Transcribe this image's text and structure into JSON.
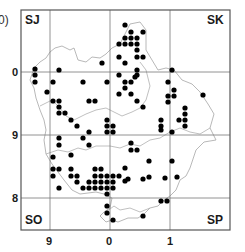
{
  "map": {
    "partial_label": "0)",
    "corner_labels": {
      "top_left": "SJ",
      "top_right": "SK",
      "bottom_left": "SO",
      "bottom_right": "SP"
    },
    "y_axis_labels": [
      "0",
      "9",
      "8"
    ],
    "x_axis_labels": [
      "9",
      "0",
      "1"
    ],
    "colors": {
      "frame": "#555555",
      "grid": "#777777",
      "boundary": "#b0b0b0",
      "dot": "#000000",
      "text": "#1a1a1a"
    },
    "dots": [
      [
        125,
        25
      ],
      [
        131,
        32
      ],
      [
        143,
        32
      ],
      [
        125,
        38
      ],
      [
        131,
        38
      ],
      [
        137,
        38
      ],
      [
        119,
        44
      ],
      [
        125,
        44
      ],
      [
        131,
        44
      ],
      [
        137,
        44
      ],
      [
        137,
        50
      ],
      [
        119,
        57
      ],
      [
        137,
        57
      ],
      [
        143,
        57
      ],
      [
        125,
        63
      ],
      [
        102,
        63
      ],
      [
        137,
        70
      ],
      [
        119,
        75
      ],
      [
        137,
        75
      ],
      [
        35,
        69
      ],
      [
        35,
        75
      ],
      [
        35,
        82
      ],
      [
        59,
        70
      ],
      [
        53,
        82
      ],
      [
        83,
        82
      ],
      [
        107,
        82
      ],
      [
        47,
        92
      ],
      [
        53,
        101
      ],
      [
        59,
        101
      ],
      [
        89,
        101
      ],
      [
        95,
        101
      ],
      [
        59,
        107
      ],
      [
        59,
        113
      ],
      [
        65,
        113
      ],
      [
        71,
        120
      ],
      [
        77,
        126
      ],
      [
        107,
        120
      ],
      [
        107,
        126
      ],
      [
        107,
        132
      ],
      [
        113,
        126
      ],
      [
        113,
        132
      ],
      [
        135,
        77
      ],
      [
        125,
        82
      ],
      [
        131,
        82
      ],
      [
        125,
        88
      ],
      [
        119,
        94
      ],
      [
        131,
        94
      ],
      [
        172,
        70
      ],
      [
        168,
        82
      ],
      [
        174,
        90
      ],
      [
        174,
        96
      ],
      [
        168,
        96
      ],
      [
        168,
        102
      ],
      [
        203,
        95
      ],
      [
        185,
        108
      ],
      [
        185,
        114
      ],
      [
        185,
        120
      ],
      [
        179,
        120
      ],
      [
        185,
        126
      ],
      [
        161,
        120
      ],
      [
        161,
        126
      ],
      [
        137,
        101
      ],
      [
        143,
        107
      ],
      [
        161,
        130
      ],
      [
        172,
        132
      ],
      [
        59,
        138
      ],
      [
        59,
        145
      ],
      [
        83,
        138
      ],
      [
        89,
        132
      ],
      [
        89,
        145
      ],
      [
        71,
        155
      ],
      [
        53,
        157
      ],
      [
        131,
        143
      ],
      [
        131,
        150
      ],
      [
        137,
        150
      ],
      [
        125,
        168
      ],
      [
        149,
        161
      ],
      [
        172,
        161
      ],
      [
        128,
        179
      ],
      [
        143,
        179
      ],
      [
        149,
        177
      ],
      [
        165,
        178
      ],
      [
        177,
        177
      ],
      [
        125,
        181
      ],
      [
        53,
        169
      ],
      [
        59,
        169
      ],
      [
        53,
        176
      ],
      [
        71,
        169
      ],
      [
        71,
        176
      ],
      [
        77,
        176
      ],
      [
        77,
        182
      ],
      [
        59,
        188
      ],
      [
        95,
        169
      ],
      [
        101,
        169
      ],
      [
        95,
        176
      ],
      [
        101,
        176
      ],
      [
        107,
        176
      ],
      [
        113,
        176
      ],
      [
        89,
        182
      ],
      [
        95,
        182
      ],
      [
        101,
        182
      ],
      [
        107,
        182
      ],
      [
        113,
        182
      ],
      [
        83,
        188
      ],
      [
        89,
        188
      ],
      [
        95,
        188
      ],
      [
        101,
        188
      ],
      [
        107,
        188
      ],
      [
        107,
        194
      ],
      [
        113,
        188
      ],
      [
        119,
        176
      ],
      [
        107,
        206
      ],
      [
        107,
        213
      ],
      [
        113,
        220
      ],
      [
        161,
        201
      ],
      [
        167,
        201
      ],
      [
        143,
        216
      ]
    ]
  }
}
